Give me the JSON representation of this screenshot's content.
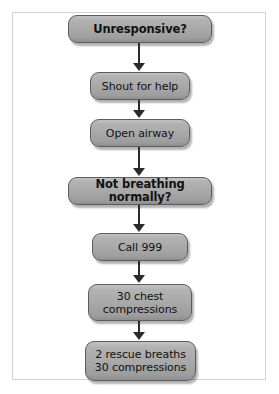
{
  "diagram": {
    "type": "flowchart",
    "orientation": "vertical",
    "title": "",
    "colors": {
      "node_fill": "#a9a9a9",
      "node_border": "#5c5c5c",
      "node_text": "#111111",
      "connector": "#2b2b2b",
      "frame_border": "#d2d2d2",
      "background": "#ffffff"
    },
    "nodes": [
      {
        "id": "unresponsive",
        "label": "Unresponsive?",
        "emphasis": true,
        "lines": 1
      },
      {
        "id": "shout-for-help",
        "label": "Shout for help",
        "emphasis": false,
        "lines": 1
      },
      {
        "id": "open-airway",
        "label": "Open airway",
        "emphasis": false,
        "lines": 1
      },
      {
        "id": "not-breathing",
        "label": "Not breathing normally?",
        "emphasis": true,
        "lines": 1
      },
      {
        "id": "call-999",
        "label": "Call 999",
        "emphasis": false,
        "lines": 1
      },
      {
        "id": "chest-compressions",
        "label": "30 chest\ncompressions",
        "emphasis": false,
        "lines": 2
      },
      {
        "id": "rescue-breaths",
        "label": "2 rescue breaths\n30 compressions",
        "emphasis": false,
        "lines": 2
      }
    ],
    "connectors": [
      {
        "from": "unresponsive",
        "to": "shout-for-help",
        "arrow": "down"
      },
      {
        "from": "shout-for-help",
        "to": "open-airway",
        "arrow": "down"
      },
      {
        "from": "open-airway",
        "to": "not-breathing",
        "arrow": "down"
      },
      {
        "from": "not-breathing",
        "to": "call-999",
        "arrow": "down"
      },
      {
        "from": "call-999",
        "to": "chest-compressions",
        "arrow": "down"
      },
      {
        "from": "chest-compressions",
        "to": "rescue-breaths",
        "arrow": "down"
      }
    ]
  }
}
